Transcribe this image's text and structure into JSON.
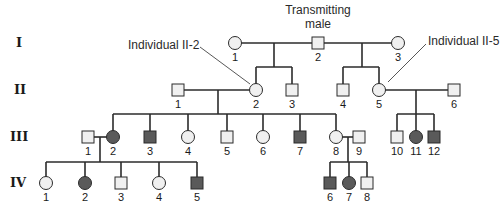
{
  "generations": [
    {
      "id": "I",
      "label": "I",
      "y": 43
    },
    {
      "id": "II",
      "label": "II",
      "y": 90
    },
    {
      "id": "III",
      "label": "III",
      "y": 137
    },
    {
      "id": "IV",
      "label": "IV",
      "y": 183
    }
  ],
  "colors": {
    "affected": "#5a5a5a",
    "unaffected": "#f0f0f0",
    "stroke": "#2b2b2b"
  },
  "individuals": {
    "I": [
      {
        "num": "1",
        "sex": "female",
        "affected": false,
        "x": 235
      },
      {
        "num": "2",
        "sex": "male",
        "affected": false,
        "x": 318
      },
      {
        "num": "3",
        "sex": "female",
        "affected": false,
        "x": 398
      }
    ],
    "II": [
      {
        "num": "1",
        "sex": "male",
        "affected": false,
        "x": 178
      },
      {
        "num": "2",
        "sex": "female",
        "affected": false,
        "x": 256
      },
      {
        "num": "3",
        "sex": "male",
        "affected": false,
        "x": 292
      },
      {
        "num": "4",
        "sex": "male",
        "affected": false,
        "x": 343
      },
      {
        "num": "5",
        "sex": "female",
        "affected": false,
        "x": 379
      },
      {
        "num": "6",
        "sex": "male",
        "affected": false,
        "x": 454
      }
    ],
    "III": [
      {
        "num": "1",
        "sex": "male",
        "affected": false,
        "x": 88
      },
      {
        "num": "2",
        "sex": "female",
        "affected": true,
        "x": 113
      },
      {
        "num": "3",
        "sex": "male",
        "affected": true,
        "x": 150
      },
      {
        "num": "4",
        "sex": "female",
        "affected": false,
        "x": 188
      },
      {
        "num": "5",
        "sex": "male",
        "affected": false,
        "x": 227
      },
      {
        "num": "6",
        "sex": "female",
        "affected": false,
        "x": 263
      },
      {
        "num": "7",
        "sex": "male",
        "affected": true,
        "x": 300
      },
      {
        "num": "8",
        "sex": "female",
        "affected": false,
        "x": 336
      },
      {
        "num": "9",
        "sex": "male",
        "affected": false,
        "x": 359
      },
      {
        "num": "10",
        "sex": "male",
        "affected": false,
        "x": 397
      },
      {
        "num": "11",
        "sex": "female",
        "affected": true,
        "x": 416
      },
      {
        "num": "12",
        "sex": "male",
        "affected": true,
        "x": 434
      }
    ],
    "IV": [
      {
        "num": "1",
        "sex": "female",
        "affected": false,
        "x": 46
      },
      {
        "num": "2",
        "sex": "female",
        "affected": true,
        "x": 85
      },
      {
        "num": "3",
        "sex": "male",
        "affected": false,
        "x": 121
      },
      {
        "num": "4",
        "sex": "female",
        "affected": false,
        "x": 159
      },
      {
        "num": "5",
        "sex": "male",
        "affected": true,
        "x": 197
      },
      {
        "num": "6",
        "sex": "male",
        "affected": true,
        "x": 330
      },
      {
        "num": "7",
        "sex": "female",
        "affected": true,
        "x": 349
      },
      {
        "num": "8",
        "sex": "male",
        "affected": false,
        "x": 367
      }
    ]
  },
  "annotations": {
    "transmitting_male_line1": "Transmitting",
    "transmitting_male_line2": "male",
    "individual_ii2": "Individual II-2",
    "individual_ii5": "Individual II-5"
  }
}
